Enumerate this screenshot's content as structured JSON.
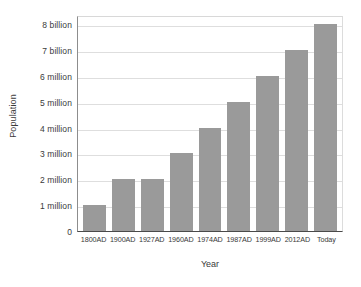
{
  "chart_data": {
    "type": "bar",
    "title": "",
    "xlabel": "Year",
    "ylabel": "Population",
    "categories": [
      "1800AD",
      "1900AD",
      "1927AD",
      "1960AD",
      "1974AD",
      "1987AD",
      "1999AD",
      "2012AD",
      "Today"
    ],
    "values": [
      1,
      2,
      2,
      3,
      4,
      5,
      6,
      7,
      8
    ],
    "ytick_labels": [
      "0",
      "1 million",
      "2 million",
      "3 million",
      "4 million",
      "5 million",
      "6 million",
      "7 billion",
      "8 billion"
    ],
    "ytick_values": [
      0,
      1,
      2,
      3,
      4,
      5,
      6,
      7,
      8
    ],
    "ylim": [
      0,
      8.35
    ],
    "bar_values_display": [
      "1 million",
      "2 million",
      "2 million",
      "3 million",
      "4 million",
      "5 million",
      "6 million",
      "7 billion",
      "8 billion"
    ],
    "grid": true,
    "legend": false,
    "bar_color": "#9a9a9a",
    "grid_color": "#dedede",
    "axis_color": "#4a4a4a",
    "text_color": "#3a3a3a",
    "background_color": "#ffffff"
  }
}
